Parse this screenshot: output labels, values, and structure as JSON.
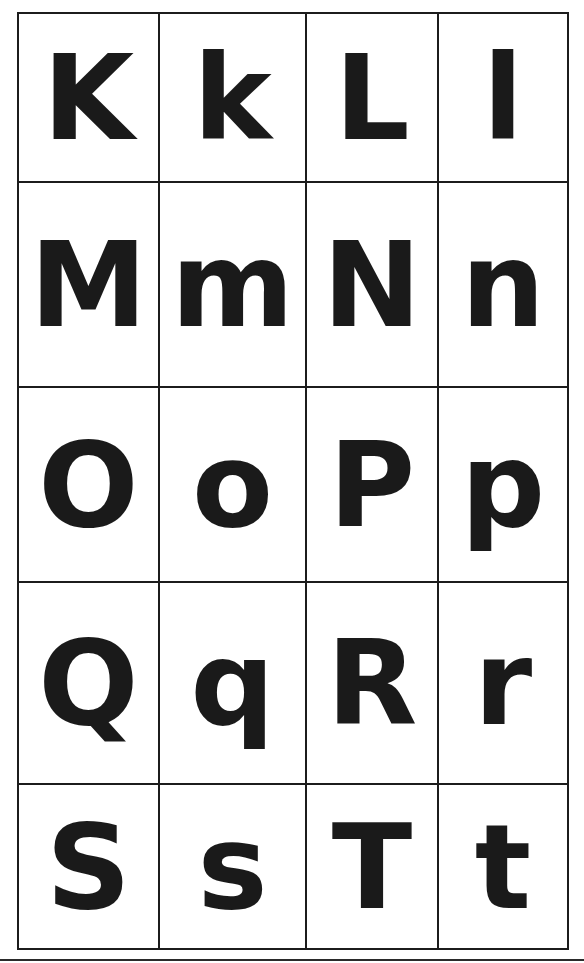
{
  "worksheet": {
    "rows": [
      {
        "cells": [
          {
            "letter": "K",
            "case": "upper"
          },
          {
            "letter": "k",
            "case": "lower"
          },
          {
            "letter": "L",
            "case": "upper"
          },
          {
            "letter": "l",
            "case": "lower"
          }
        ]
      },
      {
        "cells": [
          {
            "letter": "M",
            "case": "upper"
          },
          {
            "letter": "m",
            "case": "lower"
          },
          {
            "letter": "N",
            "case": "upper"
          },
          {
            "letter": "n",
            "case": "lower"
          }
        ]
      },
      {
        "cells": [
          {
            "letter": "O",
            "case": "upper"
          },
          {
            "letter": "o",
            "case": "lower"
          },
          {
            "letter": "P",
            "case": "upper"
          },
          {
            "letter": "p",
            "case": "lower"
          }
        ]
      },
      {
        "cells": [
          {
            "letter": "Q",
            "case": "upper"
          },
          {
            "letter": "q",
            "case": "lower"
          },
          {
            "letter": "R",
            "case": "upper"
          },
          {
            "letter": "r",
            "case": "lower"
          }
        ]
      },
      {
        "cells": [
          {
            "letter": "S",
            "case": "upper"
          },
          {
            "letter": "s",
            "case": "lower"
          },
          {
            "letter": "T",
            "case": "upper"
          },
          {
            "letter": "t",
            "case": "lower"
          }
        ]
      }
    ]
  },
  "colors": {
    "ink": "#1a1a1a",
    "grid_line": "#1c1c1c",
    "paper": "#ffffff"
  }
}
